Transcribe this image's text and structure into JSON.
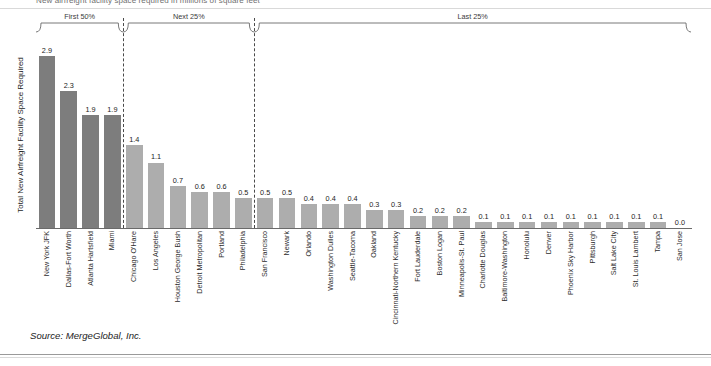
{
  "chart_data": {
    "type": "bar",
    "title": "New airfreight facility space required in millions of square feet",
    "xlabel": "",
    "ylabel": "Total New Airfreight Facility Space Required",
    "ylim": [
      0,
      3.2
    ],
    "grid": false,
    "legend": "none",
    "value_label_format": "one-decimal",
    "categories": [
      "New York JFK",
      "Dallas-Fort Worth",
      "Atlanta Hartsfield",
      "Miami",
      "Chicago O'Hare",
      "Los Angeles",
      "Houston George Bush",
      "Detroit Metropolitan",
      "Portland",
      "Philadelphia",
      "San Francisco",
      "Newark",
      "Orlando",
      "Washington Dulles",
      "Seattle-Tacoma",
      "Oakland",
      "Cincinnati-Northern Kentucky",
      "Fort Lauderdale",
      "Boston Logan",
      "Minneapolis-St. Paul",
      "Charlotte Douglas",
      "Baltimore-Washington",
      "Honolulu",
      "Denver",
      "Phoenix Sky Harbor",
      "Pittsburgh",
      "Salt Lake City",
      "St. Louis Lambert",
      "Tampa",
      "San Jose"
    ],
    "values": [
      2.9,
      2.3,
      1.9,
      1.9,
      1.4,
      1.1,
      0.7,
      0.6,
      0.6,
      0.5,
      0.5,
      0.5,
      0.4,
      0.4,
      0.4,
      0.3,
      0.3,
      0.2,
      0.2,
      0.2,
      0.1,
      0.1,
      0.1,
      0.1,
      0.1,
      0.1,
      0.1,
      0.1,
      0.1,
      0.0
    ],
    "value_labels": [
      "2.9",
      "2.3",
      "1.9",
      "1.9",
      "1.4",
      "1.1",
      "0.7",
      "0.6",
      "0.6",
      "0.5",
      "0.5",
      "0.5",
      "0.4",
      "0.4",
      "0.4",
      "0.3",
      "0.3",
      "0.2",
      "0.2",
      "0.2",
      "0.1",
      "0.1",
      "0.1",
      "0.1",
      "0.1",
      "0.1",
      "0.1",
      "0.1",
      "0.1",
      "0.0"
    ],
    "bar_colors": [
      "#7d7d7d",
      "#7d7d7d",
      "#7d7d7d",
      "#7d7d7d",
      "#adadad",
      "#adadad",
      "#adadad",
      "#adadad",
      "#adadad",
      "#adadad",
      "#adadad",
      "#adadad",
      "#adadad",
      "#adadad",
      "#adadad",
      "#adadad",
      "#adadad",
      "#adadad",
      "#adadad",
      "#adadad",
      "#adadad",
      "#adadad",
      "#adadad",
      "#adadad",
      "#adadad",
      "#adadad",
      "#adadad",
      "#adadad",
      "#adadad",
      "#adadad"
    ],
    "groups": [
      {
        "label": "First 50%",
        "start_index": 0,
        "end_index": 3
      },
      {
        "label": "Next 25%",
        "start_index": 4,
        "end_index": 9
      },
      {
        "label": "Last 25%",
        "start_index": 10,
        "end_index": 29
      }
    ],
    "annotations": {
      "dividers_after_index": [
        3,
        9
      ]
    }
  },
  "source": {
    "text": "Source: MergeGlobal, Inc."
  },
  "colors": {
    "bar_dark": "#7d7d7d",
    "bar_light": "#adadad",
    "axis": "#6a6a6a",
    "divider": "#4a4a4a",
    "text": "#1d1d1d"
  }
}
